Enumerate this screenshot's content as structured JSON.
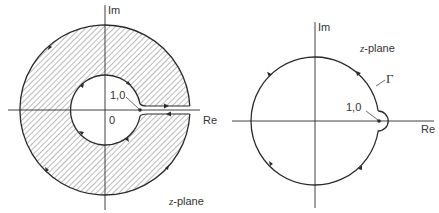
{
  "left_diagram": {
    "axis_im_label": "Im",
    "axis_re_label": "Re",
    "origin_label": "0",
    "point_label": "1,0",
    "plane_label_var": "z",
    "plane_label_rest": "-plane",
    "region": "annulus between inner and outer circle, hatched, with slot cut along positive real axis at point (1,0)"
  },
  "right_diagram": {
    "axis_im_label": "Im",
    "axis_re_label": "Re",
    "point_label": "1,0",
    "plane_label_var": "z",
    "plane_label_rest": "-plane",
    "contour_label": "Γ",
    "contour": "circle with small semicircular indentation around point (1,0), traversed clockwise"
  },
  "colors": {
    "line": "#2a2a2a",
    "hatch": "#555555",
    "background": "#ffffff"
  }
}
